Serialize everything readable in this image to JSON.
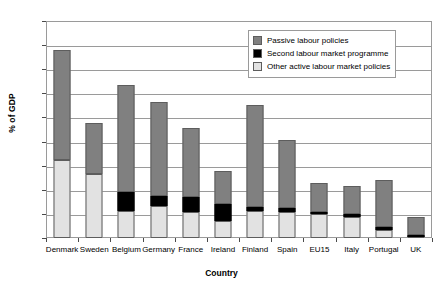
{
  "chart_data": {
    "type": "bar",
    "stacked": true,
    "title": "",
    "xlabel": "Country",
    "ylabel": "% of GDP",
    "ylim": [
      0,
      4.5
    ],
    "yticks": [
      "0",
      "0.5",
      "1",
      "1.5",
      "2",
      "2.5",
      "3",
      "3.5",
      "4",
      "4.5"
    ],
    "ytick_values": [
      0,
      0.5,
      1,
      1.5,
      2,
      2.5,
      3,
      3.5,
      4,
      4.5
    ],
    "grid": "horizontal",
    "legend_position": "top-right",
    "categories": [
      "Denmark",
      "Sweden",
      "Belgium",
      "Germany",
      "France",
      "Ireland",
      "Finland",
      "Spain",
      "EU15",
      "Italy",
      "Portugal",
      "UK"
    ],
    "series": [
      {
        "name": "Other active labour market policies",
        "color": "#e2e2e2",
        "values": [
          1.61,
          1.33,
          0.55,
          0.66,
          0.53,
          0.35,
          0.56,
          0.53,
          0.49,
          0.43,
          0.17,
          0.02
        ]
      },
      {
        "name": "Second labour market programme",
        "color": "#000000",
        "values": [
          0.0,
          0.0,
          0.41,
          0.21,
          0.33,
          0.35,
          0.09,
          0.1,
          0.05,
          0.07,
          0.06,
          0.04
        ]
      },
      {
        "name": "Passive labour policies",
        "color": "#808080",
        "values": [
          2.28,
          1.06,
          2.21,
          1.96,
          1.42,
          0.69,
          2.1,
          1.41,
          0.61,
          0.58,
          0.97,
          0.37
        ]
      }
    ],
    "totals": [
      3.89,
      2.39,
      3.17,
      2.83,
      2.28,
      1.39,
      2.75,
      2.04,
      1.15,
      1.08,
      1.2,
      0.43
    ],
    "legend_order": [
      "Passive labour policies",
      "Second labour market programme",
      "Other active labour market policies"
    ]
  },
  "legend": {
    "items": [
      {
        "label": "Passive labour policies",
        "swatch": "passive-swatch"
      },
      {
        "label": "Second labour market programme",
        "swatch": "second-swatch"
      },
      {
        "label": "Other active labour market policies",
        "swatch": "other-active-swatch"
      }
    ]
  }
}
